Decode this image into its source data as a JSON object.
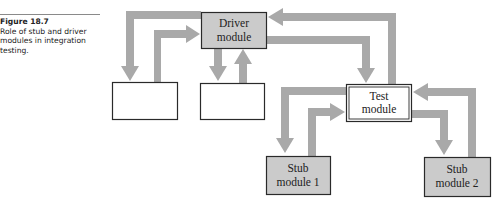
{
  "caption": {
    "figure_number": "Figure 18.7",
    "text": "Role of stub and driver modules in integration testing."
  },
  "colors": {
    "arrow": "#a9a9a9",
    "module_fill": "#cbcbcb",
    "blank_fill": "#ffffff",
    "border": "#2a2a2a"
  },
  "nodes": {
    "driver": {
      "line1": "Driver",
      "line2": "module"
    },
    "test": {
      "line1": "Test",
      "line2": "module"
    },
    "stub1": {
      "line1": "Stub",
      "line2": "module 1"
    },
    "stub2": {
      "line1": "Stub",
      "line2": "module 2"
    },
    "blank1": {
      "label": ""
    },
    "blank2": {
      "label": ""
    }
  },
  "edges": [
    {
      "from": "driver",
      "to": "blank1"
    },
    {
      "from": "blank1",
      "to": "driver"
    },
    {
      "from": "driver",
      "to": "blank2"
    },
    {
      "from": "blank2",
      "to": "driver"
    },
    {
      "from": "test",
      "to": "driver"
    },
    {
      "from": "driver",
      "to": "test"
    },
    {
      "from": "test",
      "to": "stub1"
    },
    {
      "from": "stub1",
      "to": "test"
    },
    {
      "from": "stub2",
      "to": "test"
    },
    {
      "from": "test",
      "to": "stub2"
    }
  ]
}
